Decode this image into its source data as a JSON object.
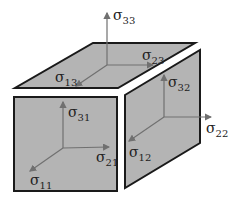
{
  "diagram": {
    "colors": {
      "face": "#b4b4b4",
      "edge": "#1a1a1a",
      "arrow": "#707070",
      "text": "#222222"
    },
    "faces": [
      {
        "name": "top-face",
        "normal": "3"
      },
      {
        "name": "front-face",
        "normal": "1"
      },
      {
        "name": "right-face",
        "normal": "2"
      }
    ],
    "labels": {
      "s33": {
        "symbol": "σ",
        "sub": "33"
      },
      "s23": {
        "symbol": "σ",
        "sub": "23"
      },
      "s13": {
        "symbol": "σ",
        "sub": "13"
      },
      "s32": {
        "symbol": "σ",
        "sub": "32"
      },
      "s22": {
        "symbol": "σ",
        "sub": "22"
      },
      "s12": {
        "symbol": "σ",
        "sub": "12"
      },
      "s31": {
        "symbol": "σ",
        "sub": "31"
      },
      "s21": {
        "symbol": "σ",
        "sub": "21"
      },
      "s11": {
        "symbol": "σ",
        "sub": "11"
      }
    }
  }
}
